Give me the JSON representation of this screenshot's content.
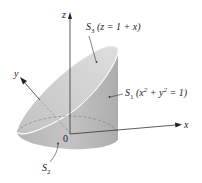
{
  "figure": {
    "type": "3D surface diagram",
    "axes": {
      "x_label": "x",
      "y_label": "y",
      "z_label": "z",
      "origin_label": "0"
    },
    "surfaces": [
      {
        "name": "S",
        "sub": "1",
        "equation_prefix": "(x",
        "sup1": "2",
        "mid": " + y",
        "sup2": "2",
        "equation_suffix": " = 1)"
      },
      {
        "name": "S",
        "sub": "2"
      },
      {
        "name": "S",
        "sub": "3",
        "equation": "(z = 1 + x)"
      }
    ],
    "colors": {
      "cylinder_side": "#bdbdbd",
      "cylinder_shade": "#a9a9a9",
      "top_surface": "#d4d4d4",
      "axis": "#333333"
    }
  }
}
